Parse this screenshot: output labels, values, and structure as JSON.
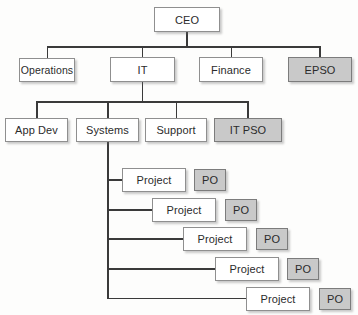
{
  "org_chart": {
    "type": "org-chart",
    "root": {
      "label": "CEO",
      "shaded": false
    },
    "executives": [
      {
        "label": "Operations",
        "shaded": false
      },
      {
        "label": "IT",
        "shaded": false
      },
      {
        "label": "Finance",
        "shaded": false
      },
      {
        "label": "EPSO",
        "shaded": true
      }
    ],
    "it_departments": [
      {
        "label": "App Dev",
        "shaded": false
      },
      {
        "label": "Systems",
        "shaded": false
      },
      {
        "label": "Support",
        "shaded": false
      },
      {
        "label": "IT PSO",
        "shaded": true
      }
    ],
    "systems_projects": [
      {
        "label": "Project",
        "po_label": "PO"
      },
      {
        "label": "Project",
        "po_label": "PO"
      },
      {
        "label": "Project",
        "po_label": "PO"
      },
      {
        "label": "Project",
        "po_label": "PO"
      },
      {
        "label": "Project",
        "po_label": "PO"
      }
    ],
    "colors": {
      "box_fill": "#ffffff",
      "shaded_fill": "#c9c9c9",
      "box_border": "#8f8f8f",
      "connector_line": "#3a3a3a",
      "text": "#2b2b2b",
      "background": "#fdfdfc"
    }
  }
}
